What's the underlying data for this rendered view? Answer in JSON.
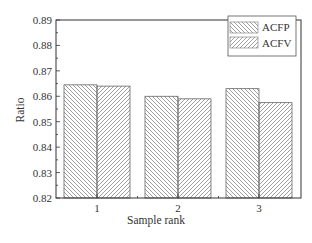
{
  "chart_data": {
    "type": "bar",
    "title": "",
    "xlabel": "Sample rank",
    "ylabel": "Ratio",
    "categories": [
      "1",
      "2",
      "3"
    ],
    "series": [
      {
        "name": "ACFP",
        "pattern": "backslash-hatch",
        "values": [
          0.8645,
          0.86,
          0.863
        ]
      },
      {
        "name": "ACFV",
        "pattern": "slash-hatch",
        "values": [
          0.864,
          0.859,
          0.8575
        ]
      }
    ],
    "ylim": [
      0.82,
      0.89
    ],
    "yticks": [
      "0.82",
      "0.83",
      "0.84",
      "0.85",
      "0.86",
      "0.87",
      "0.88",
      "0.89"
    ],
    "grid": false,
    "legend_position": "upper right",
    "colors": {
      "bar_edge": "#666666",
      "hatch": "#777777",
      "axis": "#333333"
    }
  },
  "labels": {
    "xlabel": "Sample rank",
    "ylabel": "Ratio",
    "legend": [
      "ACFP",
      "ACFV"
    ],
    "xticks": [
      "1",
      "2",
      "3"
    ],
    "yticks": [
      "0.82",
      "0.83",
      "0.84",
      "0.85",
      "0.86",
      "0.87",
      "0.88",
      "0.89"
    ]
  }
}
